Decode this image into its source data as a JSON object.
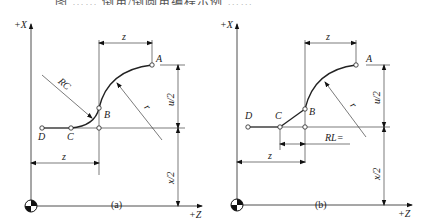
{
  "top_caption_fragment": "图 …… 倒角/倒圆角编程示例 ……",
  "diagrams": [
    {
      "caption": "(a)",
      "axis_x_label": "+X",
      "axis_z_label": "+Z",
      "points": {
        "A": "A",
        "B": "B",
        "C": "C",
        "D": "D"
      },
      "corner_label": "RC",
      "radius_label": "r",
      "dim_top": "z",
      "dim_bottom": "z",
      "dim_u": "u/2",
      "dim_x": "x/2"
    },
    {
      "caption": "(b)",
      "axis_x_label": "+X",
      "axis_z_label": "+Z",
      "points": {
        "A": "A",
        "B": "B",
        "C": "C",
        "D": "D"
      },
      "corner_label": "RL=",
      "radius_label": "r",
      "dim_top": "z",
      "dim_bottom": "z",
      "dim_u": "u/2",
      "dim_x": "x/2"
    }
  ]
}
